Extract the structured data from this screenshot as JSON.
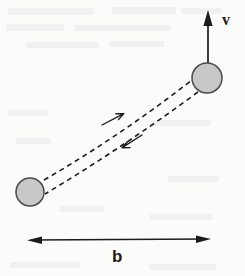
{
  "figure": {
    "kind": "scattering-impact-parameter-diagram",
    "background_color": "#fbfbfa",
    "ink_color": "#1c1c1c",
    "particle_fill_color": "#c8c8c8",
    "particle_stroke_color": "#4a4a4a",
    "labels": {
      "velocity": "v",
      "impact_parameter": "b"
    },
    "particles": [
      {
        "name": "upper-particle",
        "cx": 207,
        "cy": 78,
        "r": 15
      },
      {
        "name": "lower-particle",
        "cx": 30,
        "cy": 192,
        "r": 14
      }
    ],
    "velocity_vector": {
      "x": 208,
      "y_tail": 63,
      "y_head": 10,
      "direction": "up"
    },
    "trajectories": [
      {
        "name": "outgoing-trajectory",
        "arrow_direction": "up-right",
        "arrow_x": 112,
        "arrow_y": 119,
        "start_x": 44,
        "start_y": 180,
        "end_x": 192,
        "end_y": 80,
        "control_x": 120,
        "control_y": 136
      },
      {
        "name": "incoming-trajectory",
        "arrow_direction": "down-left",
        "arrow_x": 128,
        "arrow_y": 145,
        "start_x": 198,
        "start_y": 92,
        "end_x": 45,
        "end_y": 194,
        "control_x": 122,
        "control_y": 148
      }
    ],
    "impact_parameter_arrow": {
      "x_left": 30,
      "x_right": 208,
      "y": 240,
      "double_headed": true
    }
  }
}
